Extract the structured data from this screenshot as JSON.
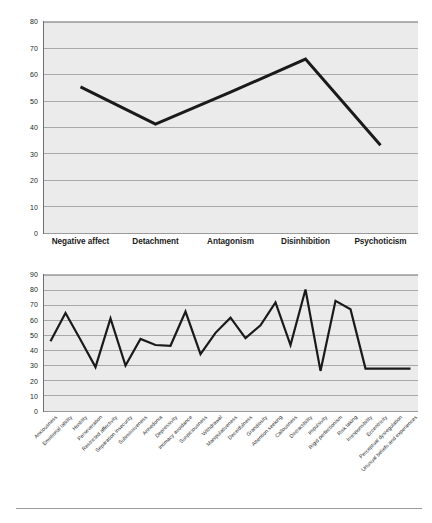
{
  "figure": {
    "background_color": "#ffffff",
    "plot_background_color": "#ebebeb",
    "gridline_color": "#a9a9a9",
    "line_color": "#1a1a1a"
  },
  "chart_data": [
    {
      "id": "domains",
      "type": "line",
      "title": "",
      "xlabel": "",
      "ylabel": "",
      "ylim": [
        0,
        80
      ],
      "yticks": [
        0,
        10,
        20,
        30,
        40,
        50,
        60,
        70,
        80
      ],
      "grid": true,
      "legend": "none",
      "categories": [
        "Negative affect",
        "Detachment",
        "Antagonism",
        "Disinhibition",
        "Psychoticism"
      ],
      "values": [
        55.5,
        41.5,
        53.5,
        66,
        33.5
      ]
    },
    {
      "id": "facets",
      "type": "line",
      "title": "",
      "xlabel": "",
      "ylabel": "",
      "ylim": [
        0,
        90
      ],
      "yticks": [
        0,
        10,
        20,
        30,
        40,
        50,
        60,
        70,
        80,
        90
      ],
      "grid": true,
      "legend": "none",
      "categories": [
        "Anxiousness",
        "Emotional lability",
        "Hostility",
        "Perseveration",
        "Restricted affectivity",
        "Separation insecurity",
        "Submissiveness",
        "Anhedonia",
        "Depressivity",
        "Intimacy avoidance",
        "Suspiciousness",
        "Withdrawal",
        "Manipulativeness",
        "Deceitfulness",
        "Grandiosity",
        "Attention seeking",
        "Callousness",
        "Distractibility",
        "Impulsivity",
        "Rigid perfectionism",
        "Risk taking",
        "Irresponsibility",
        "Eccentricity",
        "Perceptual dysregulation",
        "Unusual beliefs and experiences"
      ],
      "values": [
        46.5,
        65,
        47.5,
        29.5,
        61.5,
        30.5,
        48,
        44,
        43.5,
        66,
        38,
        52,
        62,
        48.5,
        57,
        72,
        44,
        80.5,
        27,
        73,
        67.5,
        28.5,
        28.5,
        28.5,
        28.5
      ]
    }
  ]
}
